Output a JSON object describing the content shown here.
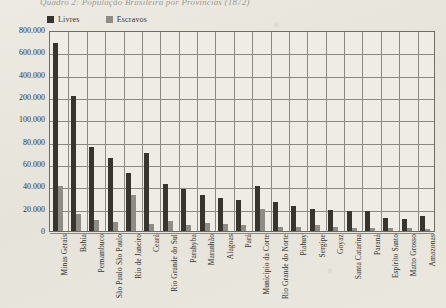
{
  "chart_data": {
    "type": "bar",
    "title": "Quadro 2: População Brasileira por Províncias (1872)",
    "xlabel": "",
    "ylabel": "",
    "grid": true,
    "legend_position": "top-left",
    "axis_note": "broken / non-linear y-axis: even spacing for 20.000, 40.000, 60.000, 80.000, 100.000, 200.000, 400.000, 600.000, 800.000",
    "yticks": [
      "800.000",
      "600.000",
      "400.000",
      "200.000",
      "100.000",
      "80.000",
      "60.000",
      "40.000",
      "20.000",
      "0"
    ],
    "ytick_values": [
      800000,
      600000,
      400000,
      200000,
      100000,
      80000,
      60000,
      40000,
      20000,
      0
    ],
    "categories": [
      "Minas Gerais",
      "Bahia",
      "Pernambuco",
      "São Paulo São Paulo",
      "Rio de Janeiro",
      "Ceará",
      "Rio Grande do Sul",
      "Parahyba",
      "Maranhão",
      "Alagoas",
      "Pará",
      "Município da Corte",
      "Rio Grande do Norte",
      "Piahuy",
      "Sergipe",
      "Goyaz",
      "Santa Catarina",
      "Paraná",
      "Espírito Santo",
      "Matto Grosso",
      "Amazonas"
    ],
    "series": [
      {
        "name": "Livres",
        "color": "#37352f",
        "values": [
          680000,
          205000,
          75000,
          65000,
          52000,
          70000,
          42000,
          38000,
          32000,
          30000,
          28000,
          40000,
          26000,
          22000,
          20000,
          19000,
          18000,
          18000,
          12000,
          11000,
          13000
        ]
      },
      {
        "name": "Escravos",
        "color": "#8e8c84",
        "values": [
          40000,
          15000,
          10000,
          8000,
          32000,
          6000,
          9000,
          5000,
          7000,
          6000,
          5000,
          20000,
          4000,
          4000,
          5000,
          4000,
          3000,
          3000,
          3000,
          3000,
          2000
        ]
      }
    ]
  },
  "legend": {
    "items": [
      {
        "label": "Livres",
        "color": "#37352f"
      },
      {
        "label": "Escravos",
        "color": "#8e8c84"
      }
    ]
  }
}
